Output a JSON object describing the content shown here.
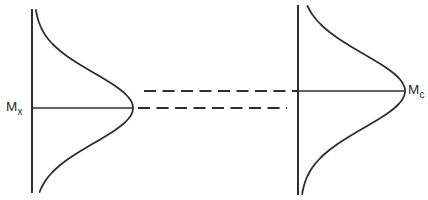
{
  "figure": {
    "type": "diagram",
    "background": "#ffffff",
    "stroke_color": "#2f2f2f",
    "label_color": "#2a2a2a",
    "left_distribution": {
      "label_base": "M",
      "label_sub": "x",
      "axis_x": 32,
      "axis_top": 9,
      "axis_bottom": 193,
      "mean_y": 108,
      "peak_x": 133,
      "sigma": 35
    },
    "right_distribution": {
      "label_base": "M",
      "label_sub": "c",
      "axis_x": 298,
      "axis_top": 5,
      "axis_bottom": 195,
      "mean_y": 91,
      "peak_x": 405,
      "sigma": 37
    },
    "dashed_lines": [
      {
        "name": "upper-dashed-line",
        "y": 91,
        "x1": 144,
        "x2": 298
      },
      {
        "name": "lower-dashed-line",
        "y": 108,
        "x1": 138,
        "x2": 287
      }
    ],
    "dash_pattern": "12 6.5"
  }
}
